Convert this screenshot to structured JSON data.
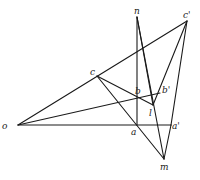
{
  "diagram": {
    "type": "perspective-construction",
    "points": {
      "o": {
        "label": "o",
        "x": 18,
        "y": 125,
        "lx": 2,
        "ly": 129
      },
      "a": {
        "label": "a",
        "x": 137,
        "y": 125,
        "lx": 131,
        "ly": 135
      },
      "a2": {
        "label": "a'",
        "x": 171,
        "y": 125,
        "lx": 172,
        "ly": 129
      },
      "c": {
        "label": "c",
        "x": 97,
        "y": 76,
        "lx": 90,
        "ly": 75
      },
      "c2": {
        "label": "c'",
        "x": 187,
        "y": 21,
        "lx": 183,
        "ly": 18
      },
      "n": {
        "label": "n",
        "x": 137,
        "y": 17,
        "lx": 134,
        "ly": 14
      },
      "b": {
        "label": "b",
        "x": 137,
        "y": 97,
        "lx": 135,
        "ly": 94
      },
      "b2": {
        "label": "b'",
        "x": 160,
        "y": 93,
        "lx": 162,
        "ly": 93
      },
      "l": {
        "label": "l",
        "x": 153,
        "y": 105,
        "lx": 149,
        "ly": 116
      },
      "m": {
        "label": "m",
        "x": 164,
        "y": 159,
        "lx": 160,
        "ly": 170
      }
    },
    "edges": [
      [
        "o",
        "c2"
      ],
      [
        "o",
        "a2"
      ],
      [
        "o",
        "b2"
      ],
      [
        "c",
        "l"
      ],
      [
        "c",
        "m"
      ],
      [
        "n",
        "a"
      ],
      [
        "n",
        "l"
      ],
      [
        "n",
        "m"
      ],
      [
        "c2",
        "l"
      ],
      [
        "c2",
        "a2"
      ],
      [
        "a2",
        "m"
      ]
    ],
    "colors": {
      "line": "#1a1a1a",
      "background": "#ffffff"
    }
  }
}
